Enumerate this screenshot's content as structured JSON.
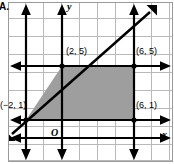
{
  "problem": {
    "label": "A."
  },
  "figure": {
    "type": "coordinate-plane-shaded-region",
    "axes": {
      "x_label": "x",
      "y_label": "y",
      "origin_label": "O"
    },
    "vertex_labels": [
      {
        "name": "top-left-vertex",
        "text": "(2, 5)",
        "x": 2,
        "y": 5
      },
      {
        "name": "top-right-vertex",
        "text": "(6, 5)",
        "x": 6,
        "y": 5
      },
      {
        "name": "bottom-left-vertex",
        "text": "(−2, 1)",
        "x": -2,
        "y": 1
      },
      {
        "name": "bottom-right-vertex",
        "text": "(6, 1)",
        "x": 6,
        "y": 1
      }
    ],
    "boundary_lines": [
      {
        "name": "line-diagonal",
        "equation": "y = x + 3",
        "style": "solid-arrow-both"
      },
      {
        "name": "line-y-equals-5",
        "equation": "y = 5",
        "style": "solid-arrow-both"
      },
      {
        "name": "line-y-equals-1",
        "equation": "y = 1",
        "style": "solid-arrow-both"
      },
      {
        "name": "line-x-equals-6",
        "equation": "x = 6",
        "style": "solid-arrow-both"
      },
      {
        "name": "line-x-equals-neg2",
        "equation": "x = −2",
        "style": "solid-arrow-both"
      }
    ],
    "shaded_region": {
      "name": "shaded-trapezoid",
      "vertices": [
        [
          -2,
          1
        ],
        [
          2,
          5
        ],
        [
          6,
          5
        ],
        [
          6,
          1
        ]
      ],
      "fill_color": "#9e9e9e"
    },
    "colors": {
      "grid_line": "#b9b9b9",
      "plate_border": "#9a9a9a",
      "boundary_line": "#000000",
      "shade_fill": "#9e9e9e",
      "background": "#ffffff"
    }
  }
}
